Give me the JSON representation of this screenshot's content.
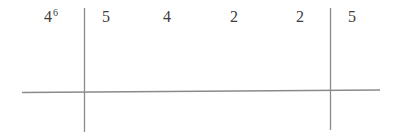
{
  "table": {
    "header_cell": {
      "base": "4",
      "exponent": "6"
    },
    "values": [
      "5",
      "4",
      "2",
      "2",
      "5"
    ]
  },
  "colors": {
    "line": "#8a8a8a",
    "text": "#3c3c3c",
    "background": "#ffffff"
  }
}
